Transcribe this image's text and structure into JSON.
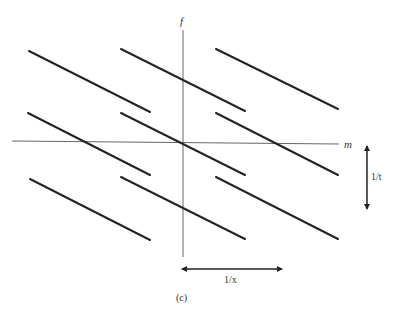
{
  "diagram": {
    "axes": {
      "vertical_label": "f",
      "horizontal_label": "m"
    },
    "arrows": {
      "vertical_label": "1/t",
      "horizontal_label": "1/x"
    },
    "caption": "(c)",
    "segments": [
      {
        "x1": 29,
        "y1": 51,
        "x2": 150,
        "y2": 112
      },
      {
        "x1": 121,
        "y1": 49,
        "x2": 245,
        "y2": 111
      },
      {
        "x1": 216,
        "y1": 49,
        "x2": 338,
        "y2": 109
      },
      {
        "x1": 28,
        "y1": 113,
        "x2": 150,
        "y2": 175
      },
      {
        "x1": 121,
        "y1": 113,
        "x2": 245,
        "y2": 175
      },
      {
        "x1": 216,
        "y1": 113,
        "x2": 338,
        "y2": 175
      },
      {
        "x1": 30,
        "y1": 179,
        "x2": 150,
        "y2": 240
      },
      {
        "x1": 121,
        "y1": 177,
        "x2": 245,
        "y2": 239
      },
      {
        "x1": 216,
        "y1": 177,
        "x2": 338,
        "y2": 239
      }
    ]
  }
}
